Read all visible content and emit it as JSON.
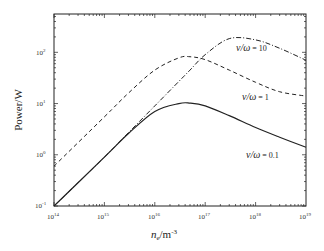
{
  "chart_data": {
    "type": "line",
    "title": "",
    "xlabel": "n_e/m^-3",
    "ylabel": "Power/W",
    "xscale": "log",
    "yscale": "log",
    "xlim": [
      100000000000000.0,
      1e+19
    ],
    "ylim": [
      0.1,
      560
    ],
    "x_tick_labels": [
      "10^14",
      "10^15",
      "10^16",
      "10^17",
      "10^18",
      "10^19"
    ],
    "y_tick_labels": [
      "10^-1",
      "10^0",
      "10^1",
      "10^2"
    ],
    "grid": false,
    "legend": "inline annotations",
    "x": [
      100000000000000.0,
      1000000000000000.0,
      3000000000000000.0,
      1e+16,
      3e+16,
      5e+16,
      1e+17,
      3e+17,
      1e+18,
      3e+18,
      1e+19
    ],
    "series": [
      {
        "name": "ν/ω = 0.1",
        "style": "solid",
        "values": [
          0.1,
          0.9,
          2.6,
          7.0,
          10.0,
          10.2,
          9.0,
          5.8,
          3.4,
          2.2,
          1.4
        ]
      },
      {
        "name": "ν/ω = 1",
        "style": "dashed",
        "values": [
          0.6,
          5.5,
          16,
          45,
          78,
          82,
          72,
          45,
          26,
          17,
          14
        ]
      },
      {
        "name": "ν/ω = 10",
        "style": "dash-dot",
        "values": [
          0.1,
          0.9,
          2.7,
          9,
          27,
          45,
          90,
          185,
          175,
          120,
          70
        ]
      }
    ],
    "annotations": [
      {
        "text": "ν/ω = 10",
        "x": 2e+18,
        "y": 100
      },
      {
        "text": "ν/ω = 1",
        "x": 1.5e+18,
        "y": 13
      },
      {
        "text": "ν/ω = 0.1",
        "x": 1.3e+18,
        "y": 1.8
      }
    ]
  },
  "labels": {
    "ylabel": "Power/W",
    "xlabel_main": "n",
    "xlabel_sub": "e",
    "xlabel_unit": "/m",
    "xlabel_exp": "-3",
    "yticks": [
      {
        "base": "10",
        "exp": "2"
      },
      {
        "base": "10",
        "exp": "1"
      },
      {
        "base": "10",
        "exp": "0"
      },
      {
        "base": "10",
        "exp": "-1"
      }
    ],
    "xticks": [
      {
        "base": "10",
        "exp": "14"
      },
      {
        "base": "10",
        "exp": "15"
      },
      {
        "base": "10",
        "exp": "16"
      },
      {
        "base": "10",
        "exp": "17"
      },
      {
        "base": "10",
        "exp": "18"
      },
      {
        "base": "10",
        "exp": "19"
      }
    ],
    "annot": [
      {
        "sym": "ν/ω",
        "val": " = 10"
      },
      {
        "sym": "ν/ω",
        "val": " = 1"
      },
      {
        "sym": "ν/ω",
        "val": " = 0.1"
      }
    ]
  }
}
